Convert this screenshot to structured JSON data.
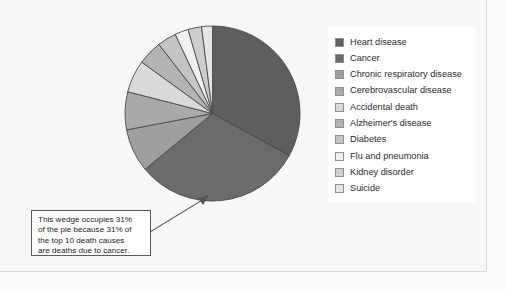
{
  "chart_data": {
    "type": "pie",
    "title": "",
    "legend_position": "right",
    "total_label": "top 10 death causes",
    "categories": [
      "Heart disease",
      "Cancer",
      "Chronic respiratory disease",
      "Cerebrovascular disease",
      "Accidental death",
      "Alzheimer's disease",
      "Diabetes",
      "Flu and pneumonia",
      "Kidney disorder",
      "Suicide"
    ],
    "values": [
      33,
      31,
      8,
      7,
      6,
      4.5,
      3.5,
      2.5,
      2.5,
      2
    ],
    "unit": "percent",
    "colors": [
      "#5e5e5e",
      "#6b6b6b",
      "#9e9e9e",
      "#a9a9a9",
      "#d9d9d9",
      "#b4b4b4",
      "#c4c4c4",
      "#f0f0f0",
      "#cdcdcd",
      "#e6e6e6"
    ],
    "wedge_border_color": "#4a4a4a",
    "highlighted_slice": "Cancer",
    "highlighted_value": 31
  },
  "legend": {
    "items": [
      {
        "label": "Heart disease",
        "color": "#5e5e5e"
      },
      {
        "label": "Cancer",
        "color": "#6b6b6b"
      },
      {
        "label": "Chronic respiratory disease",
        "color": "#9e9e9e"
      },
      {
        "label": "Cerebrovascular disease",
        "color": "#a9a9a9"
      },
      {
        "label": "Accidental death",
        "color": "#d9d9d9"
      },
      {
        "label": "Alzheimer's disease",
        "color": "#b4b4b4"
      },
      {
        "label": "Diabetes",
        "color": "#c4c4c4"
      },
      {
        "label": "Flu and pneumonia",
        "color": "#f0f0f0"
      },
      {
        "label": "Kidney disorder",
        "color": "#cdcdcd"
      },
      {
        "label": "Suicide",
        "color": "#e6e6e6"
      }
    ]
  },
  "callout": {
    "lines": [
      "This wedge occupies 31%",
      "of the pie because 31% of",
      "the top 10 death causes",
      "are deaths due to cancer."
    ]
  }
}
